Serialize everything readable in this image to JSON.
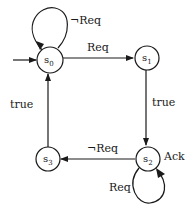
{
  "diagram": {
    "type": "state-machine",
    "states": [
      {
        "id": "s0",
        "label": "s",
        "sub": "0",
        "initial": true
      },
      {
        "id": "s1",
        "label": "s",
        "sub": "1"
      },
      {
        "id": "s2",
        "label": "s",
        "sub": "2",
        "annotation": "Ack"
      },
      {
        "id": "s3",
        "label": "s",
        "sub": "3"
      }
    ],
    "transitions": [
      {
        "from": "s0",
        "to": "s0",
        "label": "¬Req"
      },
      {
        "from": "s0",
        "to": "s1",
        "label": "Req"
      },
      {
        "from": "s1",
        "to": "s2",
        "label": "true"
      },
      {
        "from": "s2",
        "to": "s2",
        "label": "Req"
      },
      {
        "from": "s2",
        "to": "s3",
        "label": "¬Req"
      },
      {
        "from": "s3",
        "to": "s0",
        "label": "true"
      }
    ]
  }
}
